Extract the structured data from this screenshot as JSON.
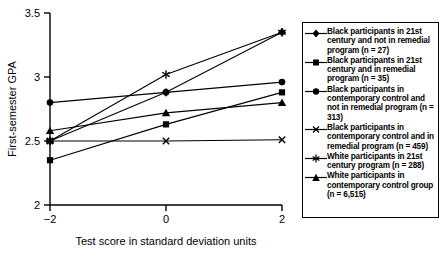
{
  "chart_data": {
    "type": "line",
    "title": "",
    "xlabel": "Test score in standard deviation units",
    "ylabel": "First-semester GPA",
    "x": [
      -2,
      0,
      2
    ],
    "xticks": [
      "-2",
      "0",
      "2"
    ],
    "yticks": [
      "2",
      "2.5",
      "3",
      "3.5"
    ],
    "xlim": [
      -2,
      2
    ],
    "ylim": [
      2,
      3.5
    ],
    "grid": false,
    "legend_position": "right",
    "series": [
      {
        "name": "Black participants in 21st century and not in remedial program (n = 27)",
        "marker": "diamond",
        "values": [
          2.5,
          2.88,
          3.35
        ]
      },
      {
        "name": "Black participants in 21st century and in remedial program (n = 35)",
        "marker": "square",
        "values": [
          2.35,
          2.63,
          2.88
        ]
      },
      {
        "name": "Black participants in contemporary control and not in remedial program (n = 313)",
        "marker": "circle",
        "values": [
          2.8,
          2.88,
          2.96
        ]
      },
      {
        "name": "Black participants in contemporary control and in remedial program (n = 459)",
        "marker": "x",
        "values": [
          2.5,
          2.5,
          2.51
        ]
      },
      {
        "name": "White participants in 21st century program (n = 288)",
        "marker": "star",
        "values": [
          2.5,
          3.02,
          3.35
        ]
      },
      {
        "name": "White participants in contemporary control group (n = 6,515)",
        "marker": "triangle",
        "values": [
          2.58,
          2.72,
          2.8
        ]
      }
    ]
  },
  "axes": {
    "y_label": "First-semester GPA",
    "x_label": "Test score in standard deviation units",
    "y_tick_labels": [
      "3.5",
      "3",
      "2.5",
      "2"
    ],
    "x_tick_labels": [
      "−2",
      "0",
      "2"
    ]
  },
  "legend": {
    "entries": [
      {
        "marker": "diamond-marker",
        "label": "Black participants in 21st century and not in remedial program (n = 27)"
      },
      {
        "marker": "square-marker",
        "label": "Black participants in 21st century and in remedial program (n = 35)"
      },
      {
        "marker": "circle-marker",
        "label": "Black participants in contemporary control and not in remedial program (n = 313)"
      },
      {
        "marker": "x-marker",
        "label": "Black participants in contemporary control and in remedial program (n = 459)"
      },
      {
        "marker": "star-marker",
        "label": "White participants in 21st century program (n = 288)"
      },
      {
        "marker": "triangle-marker",
        "label": "White participants in contemporary control group (n = 6,515)"
      }
    ]
  },
  "colors": {
    "ink": "#000000",
    "background": "#ffffff"
  }
}
